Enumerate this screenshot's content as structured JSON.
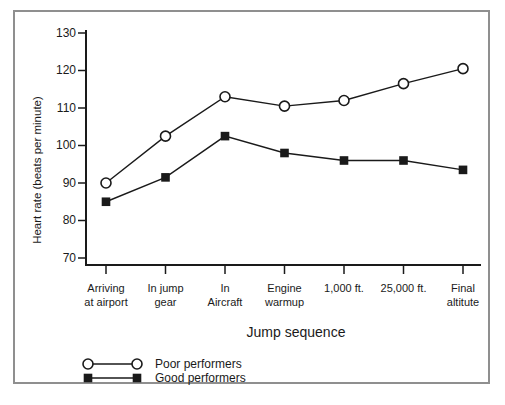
{
  "figure": {
    "background": "#ffffff",
    "frame_border_color": "#8f8f8f",
    "ink_color": "#1a1a1a"
  },
  "chart_data": {
    "type": "line",
    "title": "",
    "xlabel": "Jump sequence",
    "ylabel": "Heart rate (beats per minute)",
    "categories": [
      [
        "Arriving",
        "at airport"
      ],
      [
        "In jump",
        "gear"
      ],
      [
        "In",
        "Aircraft"
      ],
      [
        "Engine",
        "warmup"
      ],
      [
        "1,000 ft."
      ],
      [
        "25,000 ft."
      ],
      [
        "Final",
        "altitute"
      ]
    ],
    "y_ticks": [
      130,
      120,
      110,
      100,
      90,
      80,
      70
    ],
    "ylim": [
      70,
      130
    ],
    "grid": false,
    "legend_position": "bottom-left",
    "series": [
      {
        "name": "Poor performers",
        "marker": "circle-open",
        "values": [
          90,
          102.5,
          113,
          110.5,
          112,
          116.5,
          120.5
        ]
      },
      {
        "name": "Good performers",
        "marker": "square-filled",
        "values": [
          85,
          91.5,
          102.5,
          98,
          96,
          96,
          93.5
        ]
      }
    ]
  }
}
